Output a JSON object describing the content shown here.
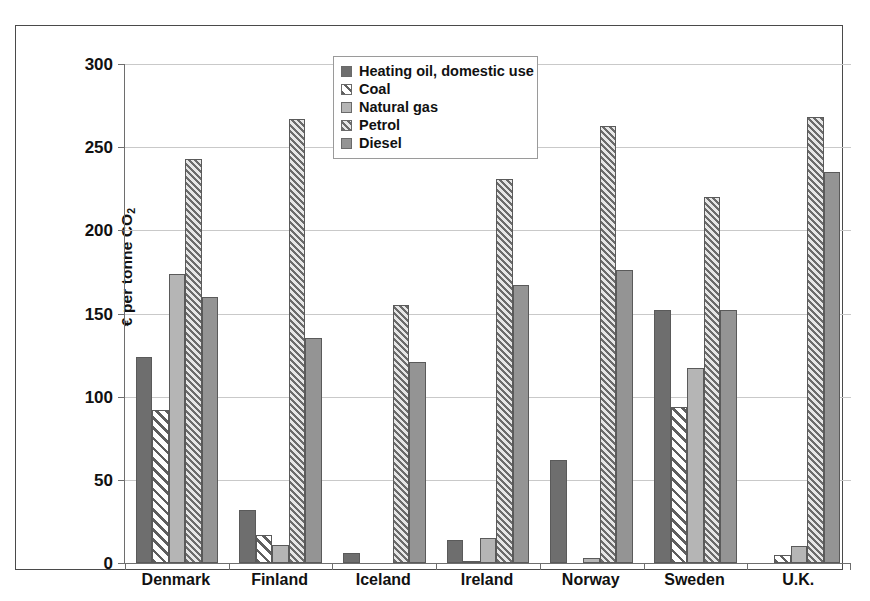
{
  "chart_data": {
    "type": "bar",
    "title": "",
    "xlabel": "",
    "ylabel": "€ per tonne CO2",
    "ylabel_text": "€ per tonne CO",
    "ylabel_sub": "2",
    "ylim": [
      0,
      300
    ],
    "ytick_step": 50,
    "yticks": [
      300,
      250,
      200,
      150,
      100,
      50,
      0
    ],
    "grid": true,
    "grid_axis": "y",
    "legend_position": "top-center",
    "categories": [
      "Denmark",
      "Finland",
      "Iceland",
      "Ireland",
      "Norway",
      "Sweden",
      "U.K."
    ],
    "series": [
      {
        "name": "Heating oil, domestic use",
        "key": "heating",
        "values": [
          124,
          32,
          6,
          14,
          62,
          152,
          0
        ]
      },
      {
        "name": "Coal",
        "key": "coal",
        "values": [
          92,
          17,
          0,
          1,
          0,
          94,
          5
        ]
      },
      {
        "name": "Natural gas",
        "key": "gas",
        "values": [
          174,
          11,
          0,
          15,
          3,
          117,
          10
        ]
      },
      {
        "name": "Petrol",
        "key": "petrol",
        "values": [
          243,
          267,
          155,
          231,
          263,
          220,
          268
        ]
      },
      {
        "name": "Diesel",
        "key": "diesel",
        "values": [
          160,
          135,
          121,
          167,
          176,
          152,
          235
        ]
      }
    ]
  },
  "colors": {
    "heating": "#6e6e6e",
    "coal": "#ffffff",
    "gas": "#b5b5b5",
    "petrol": "#d9d9d9",
    "diesel": "#949494",
    "grid": "#c9c9c9",
    "axis": "#6e6e6e",
    "frame": "#4a4a4a"
  }
}
